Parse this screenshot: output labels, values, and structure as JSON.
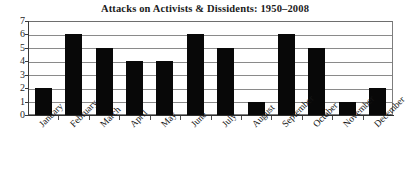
{
  "chart_data": {
    "type": "bar",
    "title": "Attacks on Activists & Dissidents: 1950–2008",
    "xlabel": "",
    "ylabel": "",
    "categories": [
      "January",
      "February",
      "March",
      "April",
      "May",
      "June",
      "July",
      "August",
      "September",
      "October",
      "November",
      "December"
    ],
    "values": [
      2,
      6,
      5,
      4,
      4,
      6,
      5,
      1,
      6,
      5,
      1,
      2
    ],
    "ylim": [
      0,
      7
    ],
    "yticks": [
      "0",
      "1",
      "2",
      "3",
      "4",
      "5",
      "6",
      "7"
    ],
    "grid": true,
    "legend": "none",
    "bar_color": "#080808",
    "grid_color": "#8a8a8a",
    "axis_color": "#2e2e2e",
    "background_color": "#ffffff"
  }
}
